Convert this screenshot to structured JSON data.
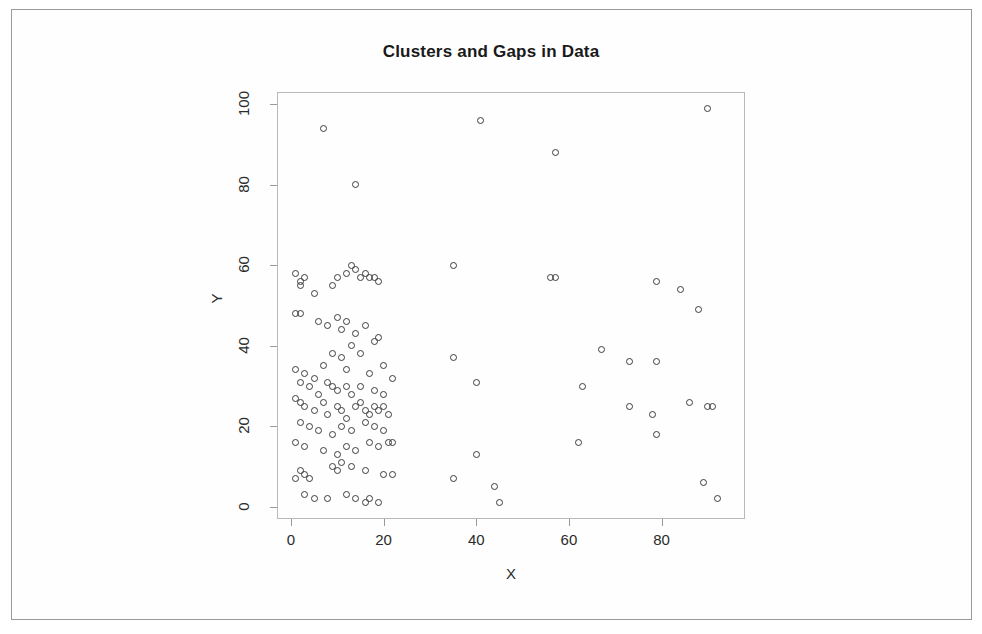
{
  "chart_data": {
    "type": "scatter",
    "title": "Clusters and Gaps in Data",
    "xlabel": "X",
    "ylabel": "Y",
    "xlim": [
      -3,
      98
    ],
    "ylim": [
      -3,
      103
    ],
    "xticks": [
      0,
      20,
      40,
      60,
      80
    ],
    "yticks": [
      0,
      20,
      40,
      60,
      80,
      100
    ],
    "grid": false,
    "legend": null,
    "marker": "open-circle",
    "marker_color": "#3c3c3c",
    "series": [
      {
        "name": "points",
        "points": [
          [
            7,
            94
          ],
          [
            14,
            80
          ],
          [
            41,
            96
          ],
          [
            57,
            88
          ],
          [
            90,
            99
          ],
          [
            1,
            58
          ],
          [
            2,
            56
          ],
          [
            2,
            55
          ],
          [
            3,
            57
          ],
          [
            5,
            53
          ],
          [
            9,
            55
          ],
          [
            10,
            57
          ],
          [
            12,
            58
          ],
          [
            13,
            60
          ],
          [
            14,
            59
          ],
          [
            15,
            57
          ],
          [
            16,
            58
          ],
          [
            17,
            57
          ],
          [
            18,
            57
          ],
          [
            19,
            56
          ],
          [
            35,
            60
          ],
          [
            56,
            57
          ],
          [
            57,
            57
          ],
          [
            79,
            56
          ],
          [
            84,
            54
          ],
          [
            88,
            49
          ],
          [
            1,
            48
          ],
          [
            2,
            48
          ],
          [
            6,
            46
          ],
          [
            8,
            45
          ],
          [
            10,
            47
          ],
          [
            11,
            44
          ],
          [
            12,
            46
          ],
          [
            14,
            43
          ],
          [
            16,
            45
          ],
          [
            18,
            41
          ],
          [
            19,
            42
          ],
          [
            13,
            40
          ],
          [
            9,
            38
          ],
          [
            11,
            37
          ],
          [
            15,
            38
          ],
          [
            7,
            35
          ],
          [
            12,
            34
          ],
          [
            20,
            35
          ],
          [
            22,
            32
          ],
          [
            35,
            37
          ],
          [
            67,
            39
          ],
          [
            73,
            36
          ],
          [
            79,
            36
          ],
          [
            1,
            34
          ],
          [
            3,
            33
          ],
          [
            2,
            31
          ],
          [
            4,
            30
          ],
          [
            5,
            32
          ],
          [
            6,
            28
          ],
          [
            8,
            31
          ],
          [
            9,
            30
          ],
          [
            10,
            29
          ],
          [
            12,
            30
          ],
          [
            13,
            28
          ],
          [
            15,
            30
          ],
          [
            17,
            33
          ],
          [
            18,
            29
          ],
          [
            20,
            28
          ],
          [
            40,
            31
          ],
          [
            63,
            30
          ],
          [
            1,
            27
          ],
          [
            2,
            26
          ],
          [
            3,
            25
          ],
          [
            5,
            24
          ],
          [
            7,
            26
          ],
          [
            8,
            23
          ],
          [
            10,
            25
          ],
          [
            11,
            24
          ],
          [
            12,
            22
          ],
          [
            14,
            25
          ],
          [
            15,
            26
          ],
          [
            16,
            24
          ],
          [
            17,
            23
          ],
          [
            18,
            25
          ],
          [
            19,
            24
          ],
          [
            20,
            25
          ],
          [
            21,
            23
          ],
          [
            73,
            25
          ],
          [
            78,
            23
          ],
          [
            86,
            26
          ],
          [
            90,
            25
          ],
          [
            91,
            25
          ],
          [
            2,
            21
          ],
          [
            4,
            20
          ],
          [
            6,
            19
          ],
          [
            9,
            18
          ],
          [
            11,
            20
          ],
          [
            13,
            19
          ],
          [
            16,
            21
          ],
          [
            18,
            20
          ],
          [
            20,
            19
          ],
          [
            79,
            18
          ],
          [
            62,
            16
          ],
          [
            1,
            16
          ],
          [
            3,
            15
          ],
          [
            7,
            14
          ],
          [
            10,
            13
          ],
          [
            12,
            15
          ],
          [
            14,
            14
          ],
          [
            17,
            16
          ],
          [
            19,
            15
          ],
          [
            21,
            16
          ],
          [
            22,
            16
          ],
          [
            40,
            13
          ],
          [
            2,
            9
          ],
          [
            3,
            8
          ],
          [
            4,
            7
          ],
          [
            1,
            7
          ],
          [
            9,
            10
          ],
          [
            10,
            9
          ],
          [
            11,
            11
          ],
          [
            13,
            10
          ],
          [
            16,
            9
          ],
          [
            20,
            8
          ],
          [
            22,
            8
          ],
          [
            35,
            7
          ],
          [
            44,
            5
          ],
          [
            3,
            3
          ],
          [
            5,
            2
          ],
          [
            8,
            2
          ],
          [
            12,
            3
          ],
          [
            14,
            2
          ],
          [
            16,
            1
          ],
          [
            17,
            2
          ],
          [
            19,
            1
          ],
          [
            45,
            1
          ],
          [
            89,
            6
          ],
          [
            92,
            2
          ]
        ]
      }
    ]
  },
  "axes": {
    "x_tick_labels": [
      "0",
      "20",
      "40",
      "60",
      "80"
    ],
    "y_tick_labels": [
      "0",
      "20",
      "40",
      "60",
      "80",
      "100"
    ]
  }
}
